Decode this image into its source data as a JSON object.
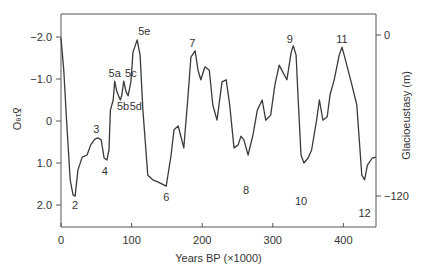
{
  "chart_data": {
    "type": "line",
    "title": "",
    "xlabel": "Years BP (×1000)",
    "ylabel": "δ¹⁸O",
    "y2label": "Glacioeustasy (m)",
    "xlim": [
      0,
      446
    ],
    "ylim": [
      2.5,
      -2.5
    ],
    "y_inverted": true,
    "grid": false,
    "legend": null,
    "x_ticks": [
      0,
      100,
      200,
      300,
      400
    ],
    "x_tick_labels": [
      "0",
      "100",
      "200",
      "300",
      "400"
    ],
    "y_ticks": [
      -2.0,
      -1.0,
      0,
      1.0,
      2.0
    ],
    "y_tick_labels": [
      "-2.0",
      "-1.0",
      "0",
      "1.0",
      "2.0"
    ],
    "y2_ticks": [
      0,
      -120
    ],
    "y2_tick_labels": [
      "0",
      "-120"
    ],
    "series": [
      {
        "name": "δ¹⁸O",
        "x": [
          0,
          4,
          8,
          13,
          17,
          20,
          24,
          30,
          37,
          42,
          48,
          52,
          57,
          61,
          65,
          68,
          70,
          74,
          76,
          79,
          84,
          86,
          89,
          92,
          95,
          99,
          102,
          108,
          112,
          116,
          123,
          130,
          137,
          149,
          156,
          160,
          166,
          170,
          174,
          180,
          184,
          190,
          194,
          198,
          204,
          210,
          215,
          221,
          228,
          234,
          239,
          245,
          251,
          255,
          259,
          265,
          272,
          278,
          285,
          290,
          297,
          303,
          309,
          314,
          320,
          326,
          329,
          333,
          336,
          340,
          344,
          350,
          355,
          362,
          366,
          371,
          377,
          381,
          387,
          394,
          398,
          403,
          412,
          419,
          426,
          430,
          434,
          441,
          446
        ],
        "values": [
          -1.98,
          -1.2,
          0,
          1.4,
          1.76,
          1.79,
          1.17,
          0.86,
          0.81,
          0.57,
          0.43,
          0.4,
          0.45,
          0.88,
          0.93,
          0.69,
          -0.26,
          -0.5,
          -0.95,
          -0.7,
          -0.5,
          -0.6,
          -0.95,
          -0.7,
          -0.6,
          -0.93,
          -1.64,
          -1.93,
          -1.57,
          -0.26,
          1.29,
          1.4,
          1.45,
          1.55,
          0.81,
          0.21,
          0.12,
          0.38,
          0.64,
          -0.62,
          -1.52,
          -1.67,
          -1.21,
          -0.98,
          -1.29,
          -1.21,
          -0.38,
          -0.02,
          -0.93,
          -0.98,
          -0.38,
          0.64,
          0.57,
          0.36,
          0.45,
          0.81,
          0.33,
          -0.26,
          -0.5,
          -0.02,
          -0.14,
          -0.86,
          -1.33,
          -1.17,
          -0.98,
          -1.64,
          -1.79,
          -1.57,
          -0.5,
          0.81,
          1.0,
          0.88,
          0.69,
          -0.02,
          -0.5,
          -0.02,
          -0.1,
          -0.62,
          -0.98,
          -1.57,
          -1.76,
          -1.45,
          -0.86,
          -0.38,
          1.29,
          1.4,
          1.05,
          0.88,
          0.86
        ]
      }
    ],
    "annotations": [
      {
        "text": "2",
        "x": 20,
        "y": 2.0
      },
      {
        "text": "3",
        "x": 50,
        "y": 0.2
      },
      {
        "text": "4",
        "x": 62,
        "y": 1.2
      },
      {
        "text": "5a",
        "x": 76,
        "y": -1.15
      },
      {
        "text": "5b",
        "x": 88,
        "y": -0.35
      },
      {
        "text": "5c",
        "x": 99,
        "y": -1.15
      },
      {
        "text": "5d",
        "x": 106,
        "y": -0.35
      },
      {
        "text": "5e",
        "x": 118,
        "y": -2.15
      },
      {
        "text": "6",
        "x": 149,
        "y": 1.8
      },
      {
        "text": "7",
        "x": 186,
        "y": -1.85
      },
      {
        "text": "8",
        "x": 262,
        "y": 1.65
      },
      {
        "text": "9",
        "x": 324,
        "y": -1.95
      },
      {
        "text": "10",
        "x": 340,
        "y": 1.9
      },
      {
        "text": "11",
        "x": 398,
        "y": -1.95
      },
      {
        "text": "12",
        "x": 430,
        "y": 2.2
      }
    ]
  },
  "colors": {
    "line": "#3a3a3a",
    "axis": "#555555",
    "text": "#333333",
    "background": "#ffffff"
  }
}
